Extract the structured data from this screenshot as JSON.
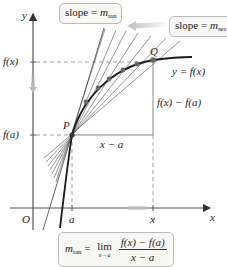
{
  "diagram": {
    "type": "secant-to-tangent illustration",
    "axes": {
      "x_label": "x",
      "y_label": "y",
      "origin_label": "O"
    },
    "tick_labels": {
      "x_axis": [
        "a",
        "x"
      ],
      "y_axis": [
        "f(a)",
        "f(x)"
      ]
    },
    "points": [
      {
        "name": "P",
        "meaning": "(a, f(a))"
      },
      {
        "name": "Q",
        "meaning": "(x, f(x))"
      }
    ],
    "curve_label": "y = f(x)",
    "rise_label": "f(x) − f(a)",
    "run_label": "x − a",
    "callouts": {
      "tangent": {
        "text": "slope = ",
        "var": "m",
        "sub": "tan"
      },
      "secant": {
        "text": "slope = ",
        "var": "m",
        "sub": "sec"
      }
    },
    "formula": {
      "lhs_var": "m",
      "lhs_sub": "tan",
      "equals": "=",
      "lim": "lim",
      "lim_sub": "x→a",
      "numerator": "f(x) − f(a)",
      "denominator": "x − a"
    },
    "colors": {
      "axis": "#555555",
      "curve": "#1a1a1a",
      "secants": "#7a7a7a",
      "dashed": "#888888",
      "point_fill": "#555555",
      "arrow_gray": "#c8c8c8",
      "box_bg": "#f7f7f4",
      "box_border": "#b9b9b9"
    }
  }
}
